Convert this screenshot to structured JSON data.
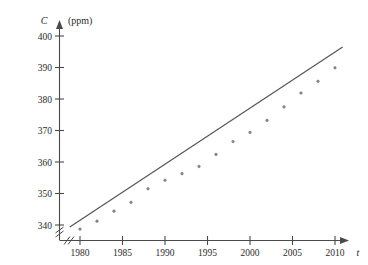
{
  "figure": {
    "background_color": "#ffffff",
    "line_color": "#555555",
    "point_color": "#8a8a8a",
    "axis_color": "#4a4a4a"
  },
  "axes": {
    "y_name": "C",
    "y_unit": "(ppm)",
    "x_name": "t",
    "y_ticks": [
      "340",
      "350",
      "360",
      "370",
      "380",
      "390",
      "400"
    ],
    "x_ticks": [
      "1980",
      "1985",
      "1990",
      "1995",
      "2000",
      "2005",
      "2010"
    ],
    "y_break": "double-slash-break",
    "x_break": "double-slash-break"
  },
  "chart_data": {
    "type": "scatter",
    "title": "",
    "subtitle": "",
    "xlabel": "t",
    "ylabel": "C (ppm)",
    "xlim": [
      1978,
      2012
    ],
    "ylim": [
      336,
      403
    ],
    "grid": false,
    "legend": "none",
    "xticks": [
      1980,
      1985,
      1990,
      1995,
      2000,
      2005,
      2010
    ],
    "yticks": [
      340,
      350,
      360,
      370,
      380,
      390,
      400
    ],
    "axis_break_x": true,
    "axis_break_y": true,
    "series": [
      {
        "name": "CO2 concentration",
        "kind": "scatter",
        "x": [
          1980,
          1982,
          1984,
          1986,
          1988,
          1990,
          1992,
          1994,
          1996,
          1998,
          2000,
          2002,
          2004,
          2006,
          2008,
          2010
        ],
        "values": [
          338.7,
          341.2,
          344.4,
          347.2,
          351.5,
          354.2,
          356.3,
          358.6,
          362.4,
          366.5,
          369.4,
          373.2,
          377.5,
          381.9,
          385.6,
          389.9
        ]
      },
      {
        "name": "Linear model",
        "kind": "line",
        "x": [
          1978.8,
          2010.9
        ],
        "values": [
          339.4,
          396.5
        ]
      }
    ],
    "annotations": []
  }
}
